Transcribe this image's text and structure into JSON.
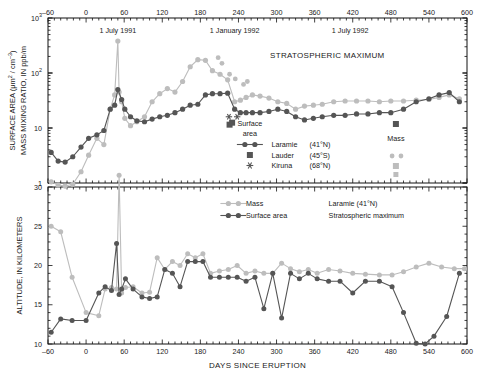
{
  "figure": {
    "xlabel": "DAYS SINCE ERUPTION",
    "annotation_stratospheric_maximum": "STRATOSPHERIC MAXIMUM",
    "date_labels": [
      {
        "text": "1 July 1991",
        "x": 50
      },
      {
        "text": "1 January 1992",
        "x": 234
      },
      {
        "text": "1 July 1992",
        "x": 416
      }
    ]
  },
  "upper_panel": {
    "ylabel_line1": "SURFACE AREA (μm",
    "ylabel_line1_sup": "2",
    "ylabel_line1_mid": " / cm",
    "ylabel_line1_sup2": "–3",
    "ylabel_line1_end": ")",
    "ylabel_line2": "MASS MIXING RATIO, IN ppb/m",
    "ytick_labels": [
      "10",
      "10",
      "10",
      "1"
    ],
    "ytick_sups": [
      "3",
      "2",
      "",
      ""
    ],
    "legend": {
      "group_title_line1": "Surface",
      "group_title_line2": "area",
      "mass_label": "Mass",
      "entries": [
        {
          "name": "Laramie",
          "lat": "(41°N)",
          "marker": "line-circle"
        },
        {
          "name": "Lauder",
          "lat": "(45°S)",
          "marker": "square"
        },
        {
          "name": "Kiruna",
          "lat": "(68°N)",
          "marker": "asterisk"
        }
      ]
    }
  },
  "lower_panel": {
    "ylabel": "ALTITUDE, IN KILOMETERS",
    "ytick_labels": [
      "30",
      "25",
      "20",
      "15",
      "10"
    ],
    "legend": {
      "mass_label": "Mass",
      "surface_area_label": "Surface area",
      "site_label": "Laramie   (41°N)",
      "subtitle": "Stratospheric maximum"
    }
  },
  "colors": {
    "dark": "#555555",
    "light": "#bdbdbd",
    "axis": "#111111",
    "background": "#ffffff"
  },
  "chart_data": {
    "type": "line",
    "xlabel": "DAYS SINCE ERUPTION",
    "xlim": [
      -60,
      600
    ],
    "xticks": [
      -60,
      0,
      60,
      120,
      180,
      240,
      300,
      360,
      420,
      480,
      540,
      600
    ],
    "panels": [
      {
        "panel": "upper",
        "ylabel": "SURFACE AREA (μm2 / cm-3)  /  MASS MIXING RATIO, IN ppb/m",
        "yscale": "log",
        "ylim": [
          1,
          1000
        ],
        "yticks": [
          1,
          10,
          100,
          1000
        ],
        "grid": false,
        "series": [
          {
            "name": "Mass (Laramie, 41°N)",
            "color": "#bdbdbd",
            "marker": "circle",
            "x": [
              -55,
              -44,
              -33,
              -21,
              -8,
              4,
              17,
              28,
              38,
              45,
              50,
              52,
              56,
              61,
              70,
              80,
              92,
              104,
              116,
              128,
              140,
              152,
              164,
              176,
              188,
              199,
              211,
              223,
              234,
              243,
              252,
              262,
              274,
              288,
              302,
              316,
              330,
              344,
              358,
              372,
              390,
              408,
              426,
              444,
              462,
              480,
              500,
              520,
              540,
              556,
              572,
              588
            ],
            "y": [
              1.05,
              0.92,
              0.88,
              0.95,
              1.6,
              3.2,
              6.5,
              5.0,
              22,
              40,
              380,
              45,
              30,
              15,
              11,
              13,
              16,
              30,
              42,
              52,
              45,
              70,
              130,
              175,
              170,
              110,
              95,
              75,
              30,
              32,
              36,
              40,
              38,
              35,
              30,
              28,
              22,
              25,
              26,
              27,
              30,
              31,
              31,
              31,
              30,
              31,
              31,
              32,
              33,
              36,
              40,
              34
            ]
          },
          {
            "name": "Surface area (Laramie, 41°N)",
            "color": "#555555",
            "marker": "circle",
            "x": [
              -55,
              -44,
              -33,
              -21,
              -8,
              4,
              17,
              28,
              38,
              45,
              50,
              56,
              61,
              70,
              80,
              92,
              104,
              116,
              128,
              140,
              152,
              164,
              176,
              188,
              199,
              211,
              223,
              234,
              243,
              252,
              262,
              274,
              288,
              302,
              316,
              330,
              344,
              358,
              372,
              390,
              408,
              426,
              444,
              462,
              480,
              500,
              520,
              540,
              556,
              572,
              588
            ],
            "y": [
              3.6,
              2.5,
              2.4,
              3.0,
              4.5,
              6.5,
              7.5,
              9.0,
              22,
              26,
              50,
              33,
              22,
              16,
              13.5,
              13,
              14.5,
              16,
              17,
              19,
              22,
              26,
              27,
              40,
              42,
              42,
              43,
              22,
              19,
              19,
              19,
              19,
              20,
              22,
              20,
              16,
              14,
              15,
              16,
              17,
              17,
              18,
              18,
              19,
              19,
              22,
              30,
              34,
              40,
              44,
              30
            ]
          },
          {
            "name": "Lauder (45°S) surface area",
            "color": "#555555",
            "marker": "square",
            "x": [
              226,
              230
            ],
            "y": [
              11.5,
              12.5
            ]
          },
          {
            "name": "Kiruna (68°N) surface area",
            "color": "#555555",
            "marker": "asterisk",
            "x": [
              225,
              238
            ],
            "y": [
              16,
              16
            ]
          },
          {
            "name": "Lauder / Kiruna mass points",
            "color": "#bdbdbd",
            "marker": "mixed",
            "x": [
              208,
              214,
              226,
              235,
              248,
              254
            ],
            "y": [
              190,
              150,
              95,
              78,
              62,
              70
            ]
          }
        ]
      },
      {
        "panel": "lower",
        "ylabel": "ALTITUDE, IN KILOMETERS",
        "yscale": "linear",
        "ylim": [
          10,
          30
        ],
        "yticks": [
          10,
          15,
          20,
          25,
          30
        ],
        "grid": false,
        "series": [
          {
            "name": "Mass",
            "color": "#bdbdbd",
            "marker": "circle",
            "x": [
              -55,
              -40,
              -22,
              0,
              20,
              30,
              40,
              48,
              52,
              56,
              62,
              74,
              88,
              100,
              112,
              124,
              136,
              148,
              160,
              172,
              184,
              196,
              210,
              224,
              238,
              252,
              266,
              280,
              294,
              308,
              322,
              336,
              350,
              364,
              382,
              400,
              420,
              440,
              462,
              482,
              500,
              520,
              540,
              560,
              580,
              596
            ],
            "y": [
              25.0,
              24.3,
              18.5,
              14.0,
              13.6,
              17.0,
              17.2,
              17.0,
              31.5,
              16.5,
              17.2,
              17.3,
              16.5,
              16.6,
              21.0,
              19.5,
              20.5,
              20.0,
              21.5,
              21.0,
              21.5,
              19.0,
              19.3,
              19.5,
              20.0,
              19.0,
              19.3,
              19.0,
              19.0,
              20.3,
              19.6,
              19.2,
              19.5,
              19.0,
              19.5,
              19.3,
              19.0,
              18.9,
              18.8,
              18.8,
              19.2,
              19.8,
              20.3,
              19.8,
              19.6,
              19.6
            ]
          },
          {
            "name": "Surface area",
            "color": "#555555",
            "marker": "circle",
            "x": [
              -55,
              -40,
              -22,
              0,
              20,
              30,
              40,
              48,
              52,
              56,
              62,
              74,
              88,
              100,
              112,
              124,
              136,
              148,
              160,
              172,
              184,
              196,
              210,
              224,
              238,
              252,
              266,
              280,
              294,
              308,
              322,
              336,
              350,
              364,
              382,
              400,
              420,
              440,
              462,
              482,
              500,
              520,
              534,
              548,
              568,
              588
            ],
            "y": [
              11.5,
              13.2,
              13.0,
              13.0,
              16.5,
              17.3,
              16.8,
              22.8,
              16.3,
              17.0,
              18.3,
              17.0,
              16.0,
              15.8,
              16.0,
              19.5,
              19.0,
              17.3,
              20.5,
              20.5,
              20.5,
              18.5,
              18.5,
              18.5,
              18.5,
              18.0,
              18.5,
              14.5,
              19.0,
              13.3,
              19.0,
              18.3,
              19.0,
              18.3,
              18.0,
              18.0,
              16.5,
              18.0,
              18.0,
              17.3,
              14.0,
              10.1,
              10.0,
              11.0,
              13.5,
              19.0
            ]
          }
        ]
      }
    ]
  }
}
